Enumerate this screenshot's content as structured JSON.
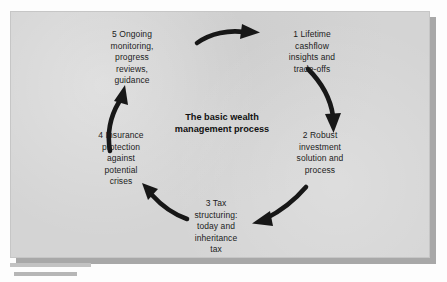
{
  "diagram": {
    "type": "cycle",
    "center_title": "The basic wealth\nmanagement process",
    "node_count": 5,
    "direction": "clockwise",
    "colors": {
      "panel_background": "#d4d4d4",
      "panel_shadow": "#a8a8a8",
      "text": "#1c1c1c",
      "arrow": "#171717",
      "page_background": "#fdfdfd",
      "caption_bar": "#c2c2c2"
    },
    "nodes": [
      {
        "number": "1",
        "position": "top-right",
        "text": "1 Lifetime\ncashflow\ninsights and\ntrade-offs"
      },
      {
        "number": "2",
        "position": "right",
        "text": "2 Robust\ninvestment\nsolution and\nprocess"
      },
      {
        "number": "3",
        "position": "bottom",
        "text": "3 Tax\nstructuring:\ntoday and\ninheritance\ntax"
      },
      {
        "number": "4",
        "position": "left",
        "text": "4 Insurance\nprotection\nagainst\npotential\ncrises"
      },
      {
        "number": "5",
        "position": "top-left",
        "text": "5 Ongoing\nmonitoring,\nprogress\nreviews,\nguidance"
      }
    ],
    "arrows": [
      {
        "name": "arrow-5-to-1",
        "from": "5",
        "to": "1",
        "shape": "curved-right"
      },
      {
        "name": "arrow-1-to-2",
        "from": "1",
        "to": "2",
        "shape": "curved-down"
      },
      {
        "name": "arrow-2-to-3",
        "from": "2",
        "to": "3",
        "shape": "curved-down-left"
      },
      {
        "name": "arrow-3-to-4",
        "from": "3",
        "to": "4",
        "shape": "curved-up-left"
      },
      {
        "name": "arrow-4-to-5",
        "from": "4",
        "to": "5",
        "shape": "curved-up"
      }
    ]
  },
  "caption": {
    "bar_top": "",
    "bar_bottom": ""
  }
}
